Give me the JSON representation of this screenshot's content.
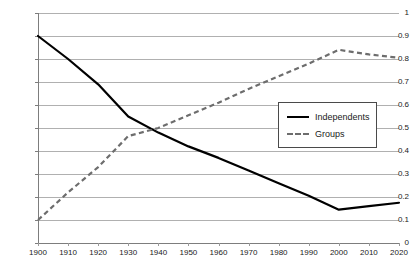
{
  "chart_data": {
    "type": "line",
    "title": "",
    "subtitle": "",
    "xlabel": "",
    "ylabel": "",
    "grid": true,
    "grid_axis": "y",
    "legend_position": "inside-right",
    "x": [
      1900,
      1910,
      1920,
      1930,
      1940,
      1950,
      1960,
      1970,
      1980,
      1990,
      2000,
      2010,
      2020
    ],
    "categories": [
      "1900",
      "1910",
      "1920",
      "1930",
      "1940",
      "1950",
      "1960",
      "1970",
      "1980",
      "1990",
      "2000",
      "2010",
      "2020"
    ],
    "xlim": [
      1900,
      2020
    ],
    "ylim": [
      0,
      1
    ],
    "ytick_labels": [
      "0",
      "0.1",
      "0.2",
      "0.3",
      "0.4",
      "0.5",
      "0.6",
      "0.7",
      "0.8",
      "0.9",
      "1"
    ],
    "ytick_values": [
      0,
      0.1,
      0.2,
      0.3,
      0.4,
      0.5,
      0.6,
      0.7,
      0.8,
      0.9,
      1
    ],
    "series": [
      {
        "name": "Independents",
        "style": "solid",
        "color": "#000000",
        "values": [
          0.9,
          0.8,
          0.69,
          0.55,
          0.48,
          0.42,
          0.37,
          0.315,
          0.26,
          0.205,
          0.145,
          0.16,
          0.175
        ]
      },
      {
        "name": "Groups",
        "style": "dashed",
        "color": "#6d6d6d",
        "values": [
          0.1,
          0.22,
          0.33,
          0.465,
          0.5,
          0.555,
          0.61,
          0.67,
          0.725,
          0.78,
          0.84,
          0.82,
          0.805
        ]
      }
    ]
  },
  "legend": {
    "entries": [
      {
        "label": "Independents"
      },
      {
        "label": "Groups"
      }
    ]
  }
}
